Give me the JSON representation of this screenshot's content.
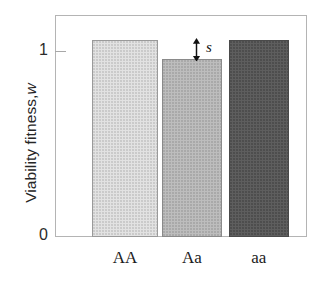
{
  "chart_data": {
    "type": "bar",
    "title": "",
    "xlabel": "",
    "ylabel": "Viability fitness, w",
    "ylabel_plain": "Viability fitness,",
    "ylabel_italic": "w",
    "categories": [
      "AA",
      "Aa",
      "aa"
    ],
    "values": [
      1.0,
      0.9,
      1.0
    ],
    "ylim": [
      0,
      1.12
    ],
    "ytick_values": [
      0,
      1
    ],
    "ytick_labels": [
      "0",
      "1"
    ],
    "grid": false,
    "legend": null,
    "annotations": [
      {
        "label": "s",
        "style": "italic",
        "kind": "double-headed-arrow",
        "from_value": 1.0,
        "to_value": 0.9,
        "meaning": "selection coefficient: fitness reduction of heterozygote Aa relative to 1"
      }
    ],
    "bar_styles": [
      {
        "category": "AA",
        "fill": "#e2e2e2",
        "stroke": "#9a9a9a",
        "texture": "stipple"
      },
      {
        "category": "Aa",
        "fill": "#bdbdbd",
        "stroke": "#8a8a8a",
        "texture": "stipple"
      },
      {
        "category": "aa",
        "fill": "#5e5e5e",
        "stroke": "#4a4a4a",
        "texture": "stipple"
      }
    ],
    "colors": {
      "background": "#ffffff",
      "frame": "#b4b4b4",
      "text": "#1a1a1a"
    }
  }
}
